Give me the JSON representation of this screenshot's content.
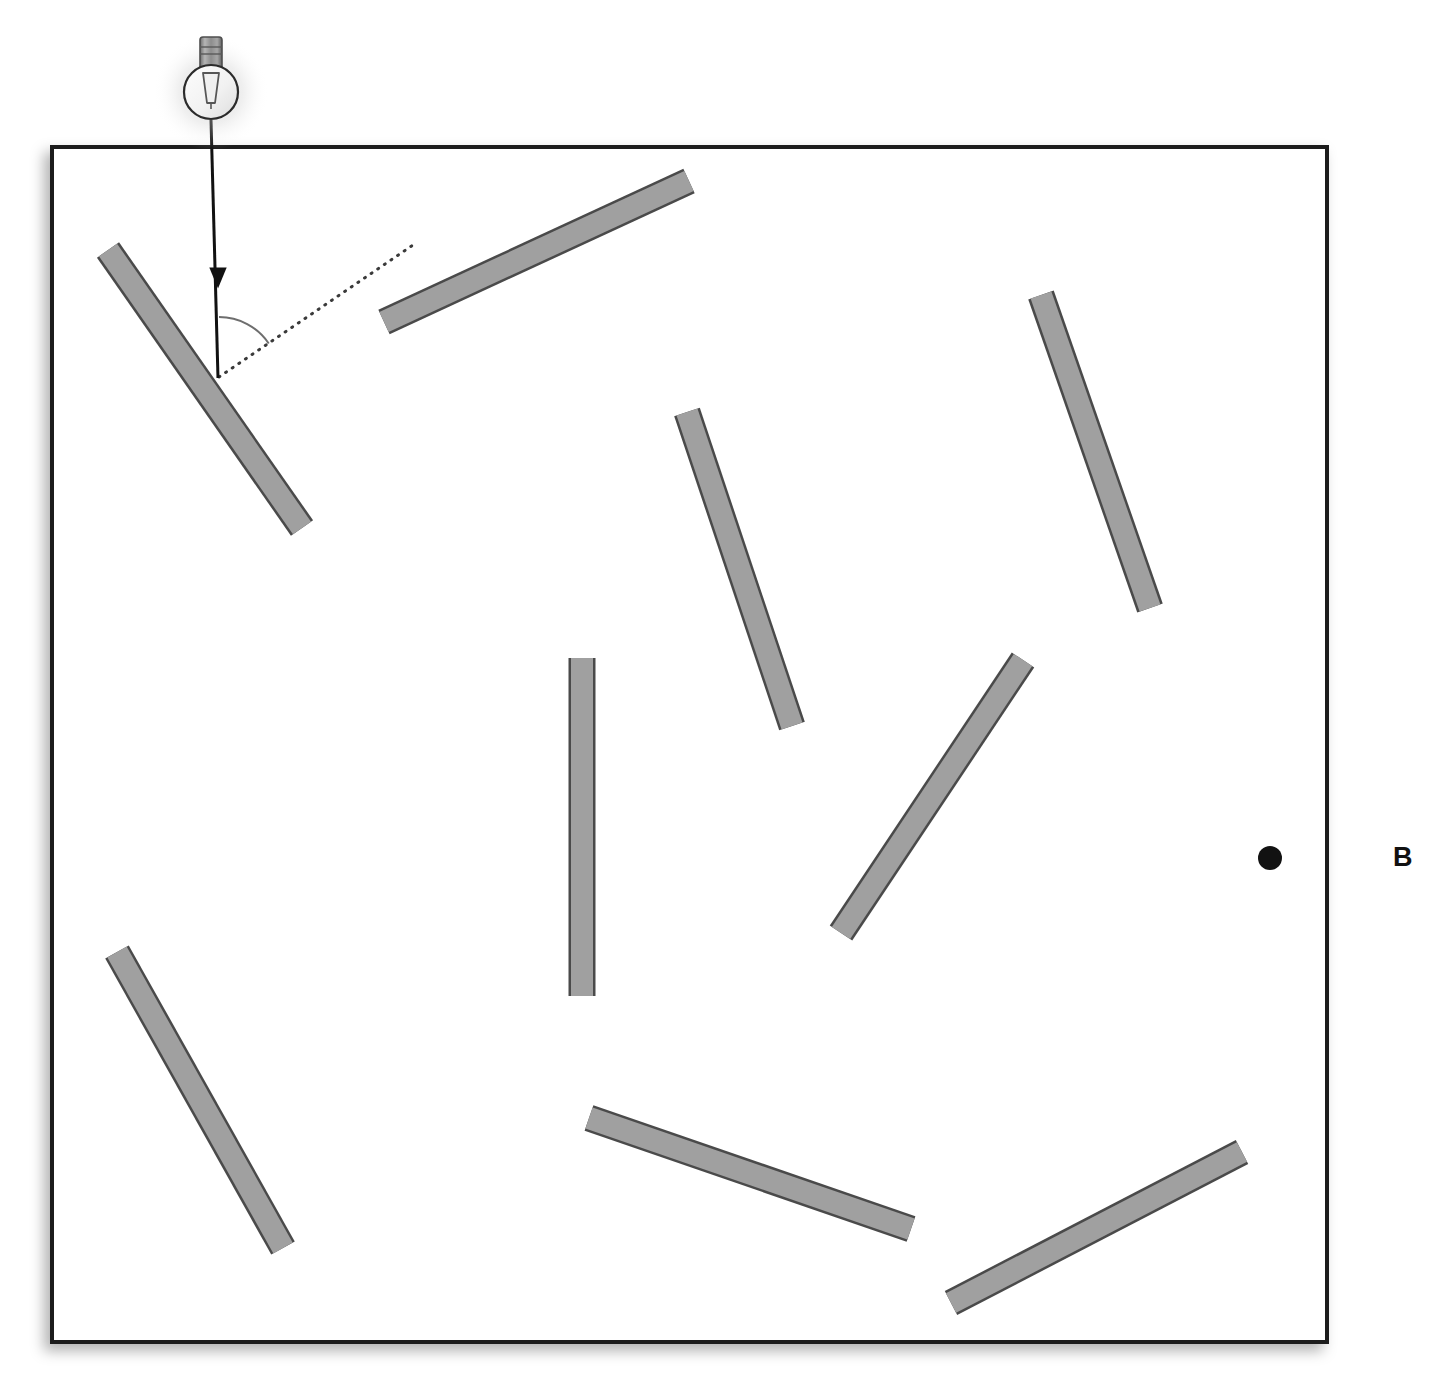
{
  "figure": {
    "title": "",
    "panel_label": "B",
    "panel_label_position": {
      "x": 1393,
      "y": 844
    },
    "background_color": "#ffffff",
    "box": {
      "name": "enclosure",
      "x": 52,
      "y": 147,
      "width": 1275,
      "height": 1195,
      "stroke_color": "#1a1a1a",
      "stroke_width": 4,
      "fill_color": "#ffffff",
      "shadow": true
    },
    "light_source": {
      "name": "light-bulb",
      "type": "incandescent-bulb",
      "cx": 211,
      "cy": 92,
      "bulb_radius": 27,
      "base_width": 22,
      "base_height": 40,
      "glass_stroke": "#2b2b2b",
      "base_fill": "#8e8e8e",
      "glow": true
    },
    "incident_ray": {
      "name": "incident-light-ray",
      "x1": 211,
      "y1": 120,
      "x2": 218,
      "y2": 378,
      "color": "#111111",
      "width": 3,
      "arrowhead": {
        "x": 218,
        "y": 278,
        "size": 14
      }
    },
    "reflected_ray": {
      "name": "reflected-ray-dotted",
      "x1": 219,
      "y1": 377,
      "x2": 416,
      "y2": 243,
      "color": "#3a3a3a",
      "style": "dotted",
      "width": 3,
      "dash": "1 7"
    },
    "angle_arc": {
      "name": "angle-of-incidence-arc",
      "cx": 219,
      "cy": 377,
      "radius": 60,
      "start_angle_deg": -90,
      "end_angle_deg": -34,
      "color": "#6e6e6e",
      "width": 2,
      "label": ""
    },
    "detector_dot": {
      "name": "detector-point",
      "cx": 1270,
      "cy": 858,
      "r": 12,
      "color": "#121212"
    },
    "bar_style": {
      "fill_color": "#a0a0a0",
      "stroke_color": "#4a4a4a",
      "stroke_width": 2.5,
      "thickness": 22
    },
    "bars": [
      {
        "name": "mirror-bar-1",
        "x1": 108,
        "y1": 250,
        "x2": 302,
        "y2": 528
      },
      {
        "name": "mirror-bar-2",
        "x1": 384,
        "y1": 322,
        "x2": 689,
        "y2": 181
      },
      {
        "name": "mirror-bar-3",
        "x1": 1041,
        "y1": 295,
        "x2": 1150,
        "y2": 608
      },
      {
        "name": "mirror-bar-4",
        "x1": 687,
        "y1": 412,
        "x2": 792,
        "y2": 726
      },
      {
        "name": "mirror-bar-5",
        "x1": 582,
        "y1": 658,
        "x2": 582,
        "y2": 996
      },
      {
        "name": "mirror-bar-6",
        "x1": 1023,
        "y1": 660,
        "x2": 841,
        "y2": 933
      },
      {
        "name": "mirror-bar-7",
        "x1": 117,
        "y1": 952,
        "x2": 283,
        "y2": 1248
      },
      {
        "name": "mirror-bar-8",
        "x1": 589,
        "y1": 1118,
        "x2": 911,
        "y2": 1229
      },
      {
        "name": "mirror-bar-9",
        "x1": 951,
        "y1": 1303,
        "x2": 1242,
        "y2": 1152
      }
    ]
  }
}
